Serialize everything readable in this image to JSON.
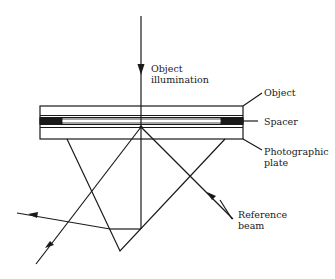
{
  "diagram": {
    "type": "holography-setup",
    "labels": {
      "object_illumination": [
        "Object",
        "illumination"
      ],
      "object": "Object",
      "spacer": "Spacer",
      "photographic_plate": [
        "Photographic",
        "plate"
      ],
      "reference_beam": [
        "Reference",
        "beam"
      ]
    },
    "colors": {
      "line": "#1a1a1a",
      "background": "#ffffff"
    }
  }
}
